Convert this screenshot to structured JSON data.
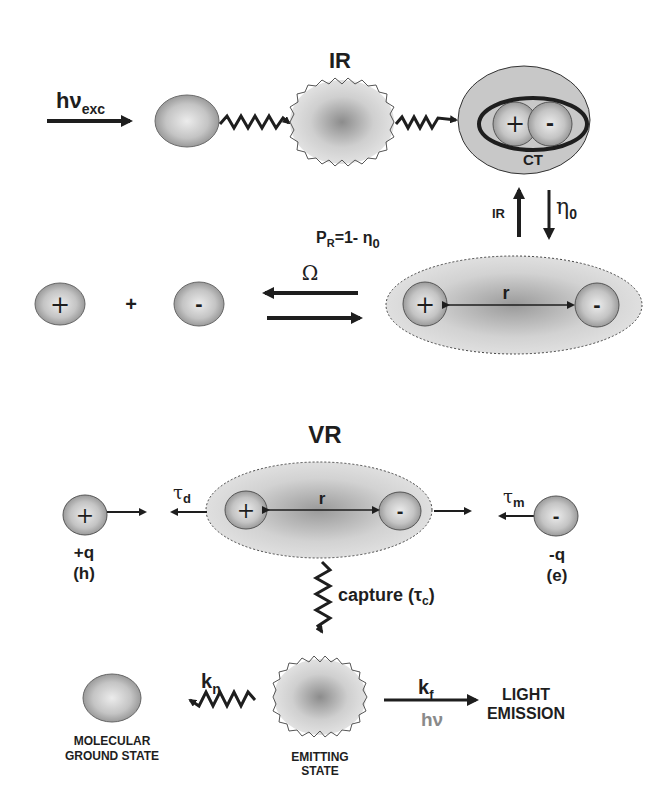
{
  "top": {
    "title": "IR",
    "excitation": {
      "main": "hν",
      "sub": "exc"
    },
    "ct_label": "CT",
    "ir_arrow_label": "IR",
    "eta_label": {
      "main": "η",
      "sub": "0"
    },
    "pr_label": {
      "main": "P",
      "sub": "R",
      "rest": "=1- η",
      "sub2": "0"
    },
    "omega_label": "Ω",
    "plus_sign": "+",
    "charge_plus": "+",
    "charge_minus": "-",
    "distance_label": "r"
  },
  "bottom": {
    "title": "VR",
    "tau_d": {
      "main": "τ",
      "sub": "d"
    },
    "tau_m": {
      "main": "τ",
      "sub": "m"
    },
    "distance_label": "r",
    "hole": {
      "charge": "+q",
      "name": "(h)"
    },
    "electron": {
      "charge": "-q",
      "name": "(e)"
    },
    "capture": {
      "text": "capture (τ",
      "sub": "c",
      "close": ")"
    },
    "kn": {
      "main": "k",
      "sub": "n"
    },
    "kf": {
      "main": "k",
      "sub": "f"
    },
    "hv": "hν",
    "ground_state": {
      "line1": "MOLECULAR",
      "line2": "GROUND STATE"
    },
    "emitting_state": {
      "line1": "EMITTING",
      "line2": "STATE"
    },
    "light_emission": {
      "line1": "LIGHT",
      "line2": "EMISSION"
    }
  },
  "colors": {
    "ink": "#1e1e1e",
    "sphere_light": "#e6e6e6",
    "sphere_dark": "#8a8a8a",
    "cloud_light": "#e2e2e2",
    "cloud_dark": "#8c8c8c",
    "hv_gray": "#8a8a8a"
  }
}
